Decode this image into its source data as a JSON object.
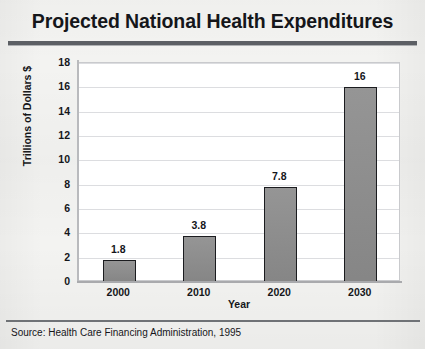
{
  "chart_data": {
    "type": "bar",
    "title": "Projected National Health Expenditures",
    "xlabel": "Year",
    "ylabel": "Trillions of Dollars $",
    "categories": [
      "2000",
      "2010",
      "2020",
      "2030"
    ],
    "values": [
      1.8,
      3.8,
      7.8,
      16
    ],
    "value_labels": [
      "1.8",
      "3.8",
      "7.8",
      "16"
    ],
    "ylim": [
      0,
      18
    ],
    "ytick_step": 2,
    "ytick_labels": [
      "18",
      "16",
      "14",
      "12",
      "10",
      "8",
      "6",
      "4",
      "2",
      "0"
    ],
    "grid": true,
    "legend": "none",
    "series": [
      {
        "name": "Projected expenditures",
        "values": [
          1.8,
          3.8,
          7.8,
          16
        ]
      }
    ],
    "bar_fill_color": "#8d8d8d",
    "bar_border_color": "#1b1c1f",
    "plot_background": "#ffffff",
    "gridline_color": "#dcdde0"
  },
  "footer": {
    "source_note": "Source:  Health Care Financing Administration, 1995"
  }
}
